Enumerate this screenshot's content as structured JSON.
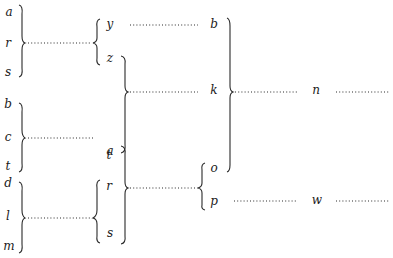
{
  "diagram": {
    "type": "bracket-tree",
    "column1": {
      "groups": [
        {
          "letters": [
            "a",
            "r",
            "s"
          ],
          "joins_to": "y-z bracket"
        },
        {
          "letters": [
            "b",
            "c",
            "t"
          ],
          "joins_to": "none (dotted line ends)"
        },
        {
          "letters": [
            "d",
            "l",
            "m"
          ],
          "joins_to": "r-s bracket"
        }
      ]
    },
    "column2": {
      "letters": [
        "y",
        "z",
        "a",
        "t",
        "r",
        "s"
      ],
      "groups": [
        {
          "letters": [
            "y",
            "z"
          ],
          "bracket": "left"
        },
        {
          "letters": [
            "z",
            "a"
          ],
          "bracket": "right",
          "joins_to": "k"
        },
        {
          "letters": [
            "r",
            "s"
          ],
          "bracket": "left"
        },
        {
          "letters": [
            "t",
            "r",
            "s"
          ],
          "bracket": "right",
          "joins_to": "o-p bracket"
        }
      ]
    },
    "column3": {
      "letters": [
        "b",
        "k",
        "o",
        "p"
      ],
      "groups": [
        {
          "letters": [
            "o",
            "p"
          ],
          "bracket": "left"
        },
        {
          "letters": [
            "b",
            "k",
            "o"
          ],
          "bracket": "right",
          "joins_to": "n"
        }
      ]
    },
    "column4": {
      "letters": [
        "n",
        "w"
      ]
    },
    "labels": {
      "c1_a": "a",
      "c1_r": "r",
      "c1_s": "s",
      "c1_b": "b",
      "c1_c": "c",
      "c1_t": "t",
      "c1_d": "d",
      "c1_l": "l",
      "c1_m": "m",
      "c2_y": "y",
      "c2_z": "z",
      "c2_a": "a",
      "c2_t": "t",
      "c2_r": "r",
      "c2_s": "s",
      "c3_b": "b",
      "c3_k": "k",
      "c3_o": "o",
      "c3_p": "p",
      "c4_n": "n",
      "c4_w": "w"
    }
  }
}
